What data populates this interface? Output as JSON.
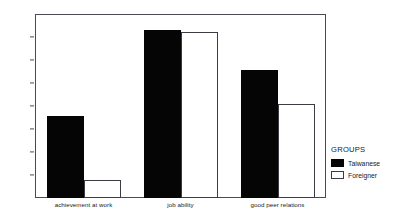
{
  "chart_data": {
    "type": "bar",
    "title": "",
    "xlabel": "",
    "ylabel": "",
    "categories": [
      "achievement at work",
      "job ability",
      "good peer relations"
    ],
    "series": [
      {
        "name": "Taiwanese",
        "values": [
          3.31,
          4.06,
          3.71
        ],
        "color": "#050505",
        "fill": "solid"
      },
      {
        "name": "Foreigner",
        "values": [
          2.76,
          4.04,
          3.42
        ],
        "color": "#ffffff",
        "fill": "outline"
      }
    ],
    "ylim": [
      2.6,
      4.2
    ],
    "ytick_step": 0.2,
    "yticks": [
      "4.2",
      "4.0",
      "3.8",
      "3.6",
      "3.4",
      "3.2",
      "3.0",
      "2.8",
      "2.6"
    ],
    "grid": false,
    "legend_position": "right",
    "legend_title": "GROUPS"
  }
}
